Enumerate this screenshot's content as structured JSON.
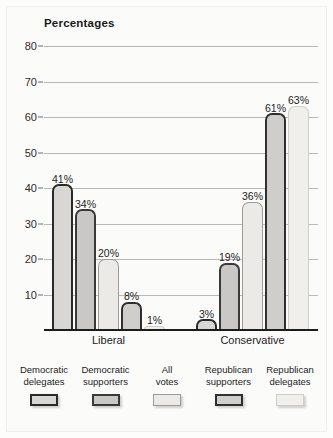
{
  "chart_data": {
    "type": "bar",
    "title": "Percentages",
    "xlabel": "",
    "ylabel": "",
    "ylim": [
      0,
      80
    ],
    "yticks": [
      10,
      20,
      30,
      40,
      50,
      60,
      70,
      80
    ],
    "grid": true,
    "legend_position": "bottom",
    "categories": [
      "Liberal",
      "Conservative"
    ],
    "series": [
      {
        "name": "Democratic delegates",
        "values": [
          41,
          3
        ],
        "swatch_fill": "#d8d7d4",
        "swatch_border": "#2a2a2a"
      },
      {
        "name": "Democratic supporters",
        "values": [
          34,
          19
        ],
        "swatch_fill": "#c9c8c5",
        "swatch_border": "#3a3a3a"
      },
      {
        "name": "All votes",
        "values": [
          20,
          36
        ],
        "swatch_fill": "#eceae7",
        "swatch_border": "#9c9b98"
      },
      {
        "name": "Republican supporters",
        "values": [
          8,
          61
        ],
        "swatch_fill": "#cfcecb",
        "swatch_border": "#2f2f2f"
      },
      {
        "name": "Republican delegates",
        "values": [
          1,
          63
        ],
        "swatch_fill": "#f1efec",
        "swatch_border": "#cfcdc9"
      }
    ],
    "data_labels": [
      [
        "41%",
        "34%",
        "20%",
        "8%",
        "1%"
      ],
      [
        "3%",
        "19%",
        "36%",
        "61%",
        "63%"
      ]
    ],
    "ytick_labels": [
      "10",
      "20",
      "30",
      "40",
      "50",
      "60",
      "70",
      "80"
    ],
    "group_labels": [
      "Liberal",
      "Conservative"
    ],
    "legend_labels": [
      [
        "Democratic",
        "delegates"
      ],
      [
        "Democratic",
        "supporters"
      ],
      [
        "All",
        "votes"
      ],
      [
        "Republican",
        "supporters"
      ],
      [
        "Republican",
        "delegates"
      ]
    ]
  }
}
